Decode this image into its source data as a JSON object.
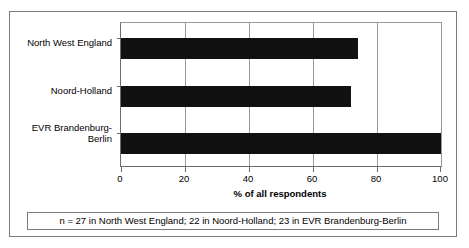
{
  "chart_data": {
    "type": "bar",
    "orientation": "horizontal",
    "title": "",
    "xlabel": "% of all respondents",
    "ylabel": "",
    "xlim": [
      0,
      100
    ],
    "xticks": [
      0,
      20,
      40,
      60,
      80,
      100
    ],
    "xtick_labels": [
      "0",
      "20",
      "40",
      "60",
      "80",
      "100"
    ],
    "grid": "vertical",
    "legend": "none",
    "bar_color": "#111111",
    "categories": [
      "North West England",
      "Noord-Holland",
      "EVR Brandenburg-Berlin"
    ],
    "values": [
      74,
      72,
      100
    ],
    "series": [
      {
        "name": "% of all respondents",
        "values": [
          74,
          72,
          100
        ]
      }
    ]
  },
  "category_labels": {
    "row0_line1": "North West England",
    "row1_line1": "Noord-Holland",
    "row2_line1": "EVR Brandenburg-",
    "row2_line2": "Berlin"
  },
  "axis": {
    "title": "% of all respondents",
    "tick0": "0",
    "tick1": "20",
    "tick2": "40",
    "tick3": "60",
    "tick4": "80",
    "tick5": "100"
  },
  "footnote": {
    "text": "n = 27 in North West England; 22 in Noord-Holland; 23 in EVR Brandenburg-Berlin"
  }
}
